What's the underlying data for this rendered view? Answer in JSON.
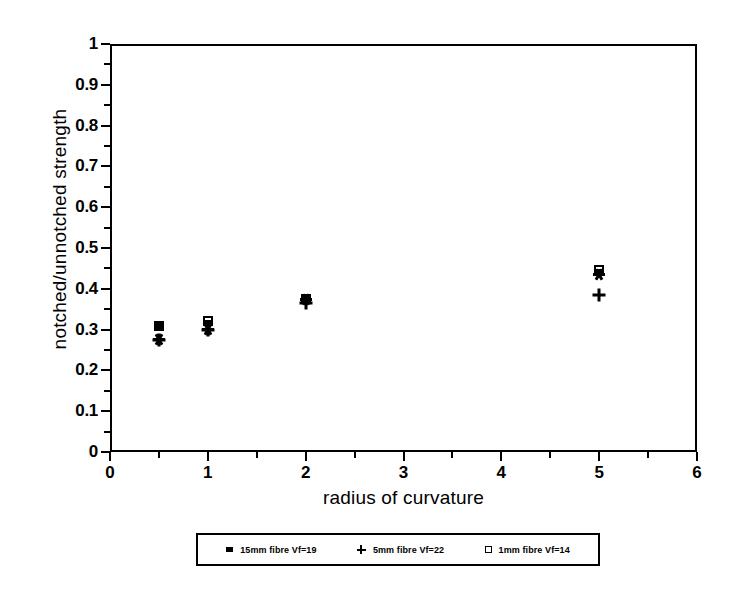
{
  "chart_data": {
    "type": "scatter",
    "title": "",
    "xlabel": "radius of curvature",
    "ylabel": "notched/unnotched strength",
    "xlim": [
      0,
      6
    ],
    "ylim": [
      0,
      1
    ],
    "xticks": [
      "0",
      "1",
      "2",
      "3",
      "4",
      "5",
      "6"
    ],
    "xtick_values": [
      0,
      1,
      2,
      3,
      4,
      5,
      6
    ],
    "yticks": [
      "0",
      "0.1",
      "0.2",
      "0.3",
      "0.4",
      "0.5",
      "0.6",
      "0.7",
      "0.8",
      "0.9",
      "1"
    ],
    "ytick_values": [
      0,
      0.1,
      0.2,
      0.3,
      0.4,
      0.5,
      0.6,
      0.7,
      0.8,
      0.9,
      1
    ],
    "grid": false,
    "legend_position": "below-axes",
    "series": [
      {
        "name": "15mm fibre Vf=19",
        "marker": "filled-square",
        "x": [
          0.5,
          1.0,
          2.0,
          5.0
        ],
        "y": [
          0.31,
          0.315,
          0.38,
          0.44
        ]
      },
      {
        "name": "5mm fibre Vf=22",
        "marker": "plus",
        "x": [
          0.5,
          1.0,
          2.0,
          5.0
        ],
        "y": [
          0.275,
          0.3,
          0.365,
          0.385
        ]
      },
      {
        "name": "1mm fibre Vf=14",
        "marker": "open-square",
        "x": [
          0.5,
          1.0,
          2.0,
          5.0
        ],
        "y": [
          0.31,
          0.32,
          0.375,
          0.445
        ]
      }
    ],
    "overlay_markers": [
      {
        "marker": "asterisk",
        "x": 0.5,
        "y": 0.275
      },
      {
        "marker": "asterisk",
        "x": 1.0,
        "y": 0.3
      },
      {
        "marker": "asterisk",
        "x": 2.0,
        "y": 0.375
      },
      {
        "marker": "asterisk",
        "x": 5.0,
        "y": 0.435
      }
    ],
    "colors": {
      "foreground": "#000000",
      "background": "#ffffff",
      "axis": "#000000"
    }
  },
  "axes": {
    "x_title": "radius of curvature",
    "y_title": "notched/unnotched strength"
  },
  "legend": {
    "entries": [
      {
        "label": "15mm fibre Vf=19",
        "marker": "filled-square"
      },
      {
        "label": "5mm fibre Vf=22",
        "marker": "plus"
      },
      {
        "label": "1mm fibre Vf=14",
        "marker": "open-square"
      }
    ]
  }
}
